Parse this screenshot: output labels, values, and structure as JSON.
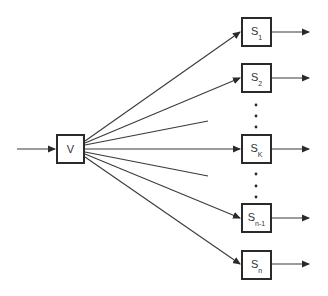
{
  "diagram": {
    "type": "fan-out block diagram",
    "source": {
      "id": "V",
      "label": "V"
    },
    "targets": [
      {
        "id": "S1",
        "base": "S",
        "sub": "1"
      },
      {
        "id": "S2",
        "base": "S",
        "sub": "2"
      },
      {
        "id": "Sk",
        "base": "S",
        "sub": "K"
      },
      {
        "id": "Sn-1",
        "base": "S",
        "sub": "n-1"
      },
      {
        "id": "Sn",
        "base": "S",
        "sub": "n"
      }
    ],
    "ellipsis_glyph": "⋮",
    "colors": {
      "line": "#2a2a2a",
      "box_border": "#2a2a2a",
      "background": "#ffffff",
      "text": "#333333"
    }
  }
}
